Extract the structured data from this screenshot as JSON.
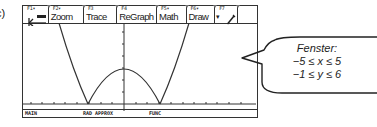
{
  "figure_label": "c)",
  "calculator": {
    "toolbar": {
      "tabs": [
        {
          "fkey": "F1▾",
          "label": "",
          "icon": "tools-icon"
        },
        {
          "fkey": "F2▾",
          "label": "Zoom"
        },
        {
          "fkey": "F3",
          "label": "Trace"
        },
        {
          "fkey": "F4",
          "label": "ReGraph"
        },
        {
          "fkey": "F5▾",
          "label": "Math"
        },
        {
          "fkey": "F6▾",
          "label": "Draw"
        },
        {
          "fkey": "F7",
          "label": "▾",
          "icon": "pencil-icon"
        },
        {
          "fkey": "",
          "label": ""
        }
      ]
    },
    "graph": {
      "function_shape": "|x^2 - 4| style: two outer rising branches and central arch, roots at x≈-2 and x≈2",
      "window": {
        "xmin": -5,
        "xmax": 5,
        "ymin": -1,
        "ymax": 6
      }
    },
    "status_bar": {
      "mode": "MAIN",
      "angle_approx": "RAD APPROX",
      "graph_mode": "FUNC"
    }
  },
  "callout": {
    "title": "Fenster:",
    "line1": "−5 ≤ x ≤ 5",
    "line2": "−1 ≤ y ≤ 6"
  }
}
